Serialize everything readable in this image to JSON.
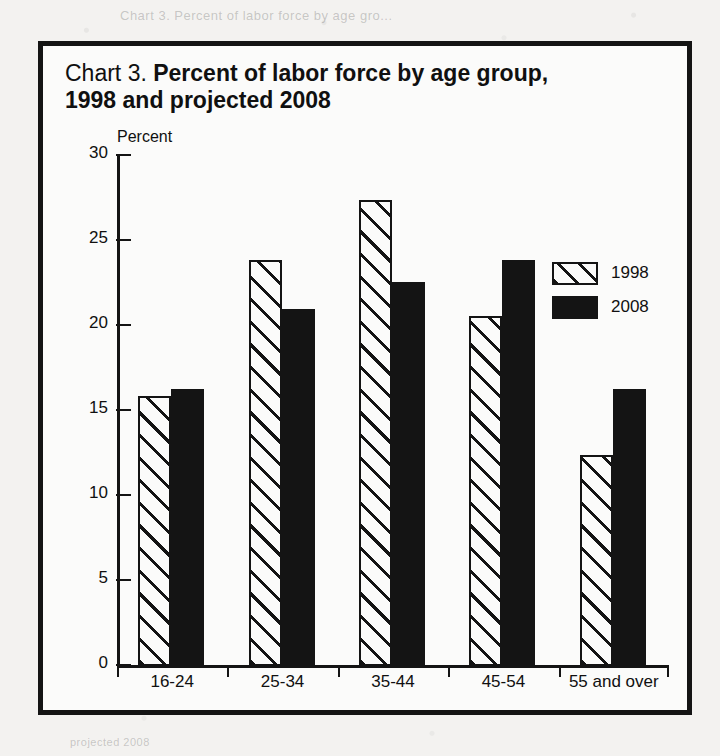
{
  "page": {
    "ghost_text_top": "Chart 3. Percent of labor force by age gro...",
    "ghost_text_bottom": "projected 2008"
  },
  "chart": {
    "title_prefix": "Chart 3.",
    "title_strong": "Percent of labor force by age group,",
    "title_line_2": "1998 and projected 2008"
  },
  "chart_data": {
    "type": "bar",
    "title": "Chart 3. Percent of labor force by age group, 1998 and projected 2008",
    "xlabel": "",
    "ylabel": "Percent",
    "ylim": [
      0,
      30
    ],
    "yticks": [
      0,
      5,
      10,
      15,
      20,
      25,
      30
    ],
    "ytick_labels": [
      "0",
      "5",
      "10",
      "15",
      "20",
      "25",
      "30"
    ],
    "grid": false,
    "legend_position": "upper right",
    "categories": [
      "16-24",
      "25-34",
      "35-44",
      "45-54",
      "55 and over"
    ],
    "series": [
      {
        "name": "1998",
        "style": "diagonal-hatch",
        "color": "#141414",
        "values": [
          15.9,
          23.9,
          27.4,
          20.6,
          12.4
        ]
      },
      {
        "name": "2008",
        "style": "solid",
        "color": "#141414",
        "values": [
          16.3,
          21.0,
          22.6,
          23.9,
          16.3
        ]
      }
    ]
  },
  "legend": {
    "items": [
      {
        "label": "1998"
      },
      {
        "label": "2008"
      }
    ]
  }
}
